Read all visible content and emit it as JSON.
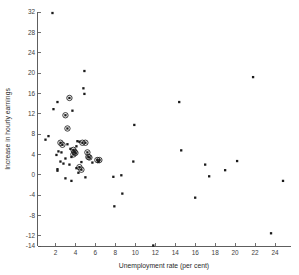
{
  "chart_data": {
    "type": "scatter",
    "title": "",
    "xlabel": "Unemployment rate (per cent)",
    "ylabel": "Increase in hourly earnings",
    "xlim": [
      0.2,
      25.6
    ],
    "ylim": [
      -14,
      32
    ],
    "xticks": [
      2,
      4,
      6,
      8,
      10,
      12,
      14,
      16,
      18,
      20,
      22,
      24
    ],
    "yticks": [
      -14,
      -12,
      -8,
      -4,
      0,
      4,
      8,
      12,
      16,
      20,
      24,
      28,
      32
    ],
    "grid": false,
    "legend": false,
    "series": [
      {
        "name": "plain",
        "marker": "filled-square-dot",
        "points": [
          [
            1.7,
            31.8
          ],
          [
            1.0,
            6.9
          ],
          [
            1.3,
            7.6
          ],
          [
            1.8,
            12.9
          ],
          [
            2.2,
            14.3
          ],
          [
            4.9,
            20.4
          ],
          [
            4.8,
            17.0
          ],
          [
            4.9,
            15.9
          ],
          [
            3.7,
            12.6
          ],
          [
            2.1,
            3.9
          ],
          [
            2.3,
            4.6
          ],
          [
            2.6,
            4.4
          ],
          [
            2.5,
            2.6
          ],
          [
            2.2,
            1.1
          ],
          [
            2.2,
            0.8
          ],
          [
            2.8,
            2.2
          ],
          [
            3.0,
            3.2
          ],
          [
            3.4,
            2.0
          ],
          [
            3.2,
            6.0
          ],
          [
            3.5,
            5.1
          ],
          [
            3.6,
            3.5
          ],
          [
            4.1,
            5.6
          ],
          [
            4.2,
            6.6
          ],
          [
            4.4,
            6.5
          ],
          [
            4.1,
            1.3
          ],
          [
            4.3,
            0.4
          ],
          [
            3.0,
            -0.7
          ],
          [
            3.6,
            -1.2
          ],
          [
            5.0,
            -0.5
          ],
          [
            4.6,
            2.5
          ],
          [
            5.7,
            2.4
          ],
          [
            6.3,
            2.5
          ],
          [
            7.8,
            -0.4
          ],
          [
            8.6,
            -0.1
          ],
          [
            8.7,
            -3.7
          ],
          [
            7.9,
            -6.2
          ],
          [
            9.9,
            9.8
          ],
          [
            9.8,
            2.6
          ],
          [
            11.8,
            -13.9
          ],
          [
            14.4,
            14.3
          ],
          [
            14.6,
            4.8
          ],
          [
            16.0,
            -4.5
          ],
          [
            17.0,
            2.0
          ],
          [
            17.4,
            -0.3
          ],
          [
            19.0,
            0.9
          ],
          [
            20.2,
            2.7
          ],
          [
            21.8,
            19.2
          ],
          [
            23.6,
            -11.5
          ],
          [
            24.8,
            -1.2
          ]
        ]
      },
      {
        "name": "circled",
        "marker": "dot-in-circle",
        "points": [
          [
            3.4,
            15.1
          ],
          [
            3.0,
            11.7
          ],
          [
            3.2,
            9.1
          ],
          [
            2.5,
            6.3
          ],
          [
            2.7,
            5.9
          ],
          [
            3.8,
            4.9
          ],
          [
            3.9,
            4.5
          ],
          [
            3.8,
            4.0
          ],
          [
            4.0,
            4.3
          ],
          [
            4.7,
            6.3
          ],
          [
            5.0,
            6.3
          ],
          [
            5.2,
            4.4
          ],
          [
            5.3,
            3.5
          ],
          [
            5.4,
            3.4
          ],
          [
            6.2,
            2.9
          ],
          [
            6.4,
            2.9
          ],
          [
            4.4,
            1.5
          ],
          [
            4.6,
            1.0
          ]
        ]
      }
    ]
  }
}
